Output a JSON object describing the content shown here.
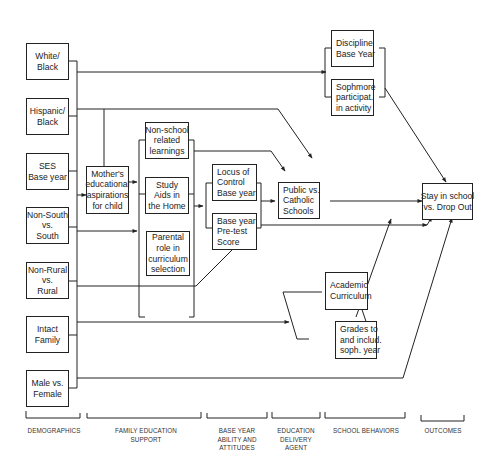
{
  "diagram": {
    "type": "path-model",
    "nodes": {
      "white_black": [
        "White/",
        "Black"
      ],
      "hispanic_black": [
        "Hispanic/",
        "Black"
      ],
      "ses": [
        "SES",
        "Base year"
      ],
      "nonsouth_south": [
        "Non-South",
        "vs.",
        "South"
      ],
      "nonrural_rural": [
        "Non-Rural",
        "vs.",
        "Rural"
      ],
      "intact_family": [
        "Intact",
        "Family"
      ],
      "male_female": [
        "Male vs.",
        "Female"
      ],
      "mothers_aspirations": [
        "Mother's",
        "educational",
        "aspirations",
        "for child"
      ],
      "nonschool_learnings": [
        "Non-school",
        "related",
        "learnings"
      ],
      "study_aids": [
        "Study",
        "Aids in",
        "the Home"
      ],
      "parental_role": [
        "Parental",
        "role in",
        "curriculum",
        "selection"
      ],
      "locus_of_control": [
        "Locus of",
        "Control",
        "Base year"
      ],
      "pretest_score": [
        "Base year",
        "Pre-test",
        "Score"
      ],
      "public_catholic": [
        "Public vs.",
        "Catholic",
        "Schools"
      ],
      "discipline": [
        "Discipline",
        "Base Year"
      ],
      "sophomore_activity": [
        "Sophmore",
        "participat.",
        "in activity"
      ],
      "academic_curriculum": [
        "Academic",
        "Curriculum"
      ],
      "grades": [
        "Grades to",
        "and includ.",
        "soph. year"
      ],
      "stay_dropout": [
        "Stay in school",
        "vs. Drop Out"
      ]
    },
    "categories": {
      "demographics": [
        "DEMOGRAPHICS"
      ],
      "family_support": [
        "FAMILY EDUCATION",
        "SUPPORT"
      ],
      "ability_attitudes": [
        "BASE YEAR",
        "ABILITY AND",
        "ATTITUDES"
      ],
      "delivery_agent": [
        "EDUCATION",
        "DELIVERY",
        "AGENT"
      ],
      "school_behaviors": [
        "SCHOOL BEHAVIORS"
      ],
      "outcomes": [
        "OUTCOMES"
      ]
    }
  }
}
